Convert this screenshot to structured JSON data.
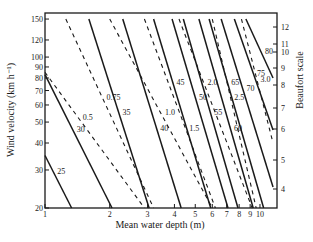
{
  "chart_data": {
    "type": "line",
    "title": "",
    "xlabel": "Mean water depth (m)",
    "ylabel": "Wind velocity (km h⁻¹)",
    "y2label": "Beaufort scale",
    "x_scale": "log",
    "y_scale": "log",
    "xlim": [
      1,
      12
    ],
    "ylim": [
      20,
      160
    ],
    "grid": false,
    "legend": "none (lines labeled inline)",
    "x_ticks": [
      1,
      2,
      3,
      4,
      5,
      6,
      7,
      8,
      9,
      10
    ],
    "x_tick_labels": [
      "1",
      "2",
      "3",
      "4",
      "5",
      "6",
      "7",
      "8",
      "9",
      "10"
    ],
    "y_ticks": [
      20,
      30,
      40,
      50,
      60,
      70,
      80,
      90,
      100,
      120,
      150
    ],
    "y_tick_labels": [
      "20",
      "30",
      "40",
      "50",
      "60",
      "70",
      "80",
      "90",
      "100",
      "120",
      "150"
    ],
    "y2_ticks": [
      4,
      5,
      6,
      7,
      8,
      9,
      10,
      11,
      12
    ],
    "y2_tick_labels": [
      "4",
      "5",
      "6",
      "7",
      "8",
      "9",
      "10",
      "11",
      "12"
    ],
    "series": [
      {
        "name": "25",
        "style": "solid",
        "x": [
          1.0,
          1.33
        ],
        "y": [
          35,
          20
        ]
      },
      {
        "name": "30",
        "style": "solid",
        "x": [
          1.0,
          2.05
        ],
        "y": [
          83,
          20
        ]
      },
      {
        "name": "35",
        "style": "solid",
        "x": [
          1.6,
          3.05
        ],
        "y": [
          150,
          20
        ]
      },
      {
        "name": "40",
        "style": "solid",
        "x": [
          2.3,
          4.3
        ],
        "y": [
          150,
          20
        ]
      },
      {
        "name": "45",
        "style": "solid",
        "x": [
          3.2,
          5.9
        ],
        "y": [
          150,
          20
        ]
      },
      {
        "name": "50",
        "style": "solid",
        "x": [
          3.9,
          7.1
        ],
        "y": [
          150,
          20
        ]
      },
      {
        "name": "55",
        "style": "solid",
        "x": [
          4.4,
          7.9
        ],
        "y": [
          150,
          20
        ]
      },
      {
        "name": "60",
        "style": "solid",
        "x": [
          5.2,
          9.3
        ],
        "y": [
          150,
          20
        ]
      },
      {
        "name": "65",
        "style": "solid",
        "x": [
          5.8,
          10.4
        ],
        "y": [
          150,
          20
        ]
      },
      {
        "name": "70",
        "style": "solid",
        "x": [
          6.6,
          11.5
        ],
        "y": [
          150,
          25
        ]
      },
      {
        "name": "75",
        "style": "solid",
        "x": [
          7.6,
          11.5
        ],
        "y": [
          150,
          46
        ]
      },
      {
        "name": "80",
        "style": "solid",
        "x": [
          8.6,
          11.5
        ],
        "y": [
          150,
          80
        ]
      },
      {
        "name": "0.5",
        "style": "dashed",
        "x": [
          1.0,
          2.9
        ],
        "y": [
          85,
          20
        ]
      },
      {
        "name": "0.75",
        "style": "dashed",
        "x": [
          1.25,
          3.2
        ],
        "y": [
          150,
          20
        ]
      },
      {
        "name": "1.0",
        "style": "dashed",
        "x": [
          2.0,
          6.0
        ],
        "y": [
          150,
          20
        ]
      },
      {
        "name": "1.5",
        "style": "dashed",
        "x": [
          2.9,
          6.2
        ],
        "y": [
          150,
          20
        ]
      },
      {
        "name": "2.0",
        "style": "dashed",
        "x": [
          4.2,
          9.2
        ],
        "y": [
          150,
          20
        ]
      },
      {
        "name": "2.5",
        "style": "dashed",
        "x": [
          6.0,
          9.6
        ],
        "y": [
          150,
          20
        ]
      },
      {
        "name": "3.0",
        "style": "dashed",
        "x": [
          8.2,
          11.5
        ],
        "y": [
          150,
          40
        ]
      }
    ],
    "annotations": {
      "solid_line_labels": [
        "25",
        "30",
        "35",
        "40",
        "45",
        "50",
        "55",
        "60",
        "65",
        "70",
        "75",
        "80"
      ],
      "dashed_line_labels": [
        "0.5",
        "0.75",
        "1.0",
        "1.5",
        "2.0",
        "2.5",
        "3.0"
      ]
    }
  },
  "labels": {
    "xlabel": "Mean water depth (m)",
    "ylabel": "Wind velocity (km h⁻¹)",
    "y2label": "Beaufort scale"
  }
}
